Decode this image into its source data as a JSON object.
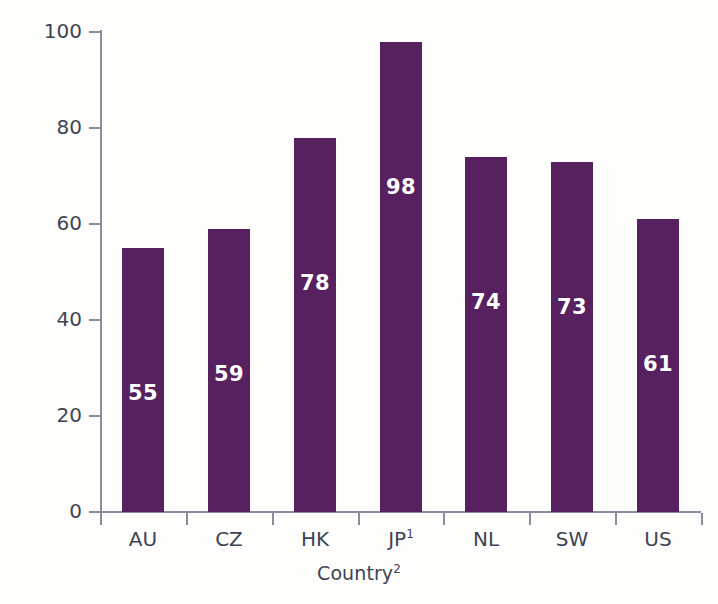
{
  "chart_data": {
    "type": "bar",
    "title": "",
    "xlabel": "Country",
    "xlabel_superscript": "2",
    "ylabel": "Percentage of problems",
    "categories": [
      "AU",
      "CZ",
      "HK",
      "JP",
      "NL",
      "SW",
      "US"
    ],
    "category_superscripts": [
      "",
      "",
      "",
      "1",
      "",
      "",
      ""
    ],
    "values": [
      55,
      59,
      78,
      98,
      74,
      73,
      61
    ],
    "bar_labels": [
      "55",
      "59",
      "78",
      "98",
      "74",
      "73",
      "61"
    ],
    "ylim": [
      0,
      100
    ],
    "yticks": [
      0,
      20,
      40,
      60,
      80,
      100
    ],
    "ytick_labels": [
      "0",
      "20",
      "40",
      "60",
      "80",
      "100"
    ],
    "grid": false,
    "legend": false,
    "legend_position": "none",
    "bar_color": "#57215f",
    "bar_label_color": "#ffffff",
    "axis_color": "#8a8fa0",
    "text_color": "#3f4454",
    "background_color": "#fdfdfb"
  }
}
